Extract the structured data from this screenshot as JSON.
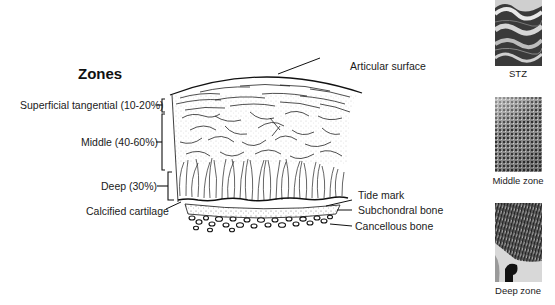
{
  "title": "Zones",
  "zone_labels": [
    {
      "label": "Superficial tangential (10-20%)"
    },
    {
      "label": "Middle (40-60%)"
    },
    {
      "label": "Deep (30%)"
    },
    {
      "label": "Calcified cartilage"
    }
  ],
  "structure_labels": [
    {
      "label": "Articular surface"
    },
    {
      "label": "Tide mark"
    },
    {
      "label": "Subchondral bone"
    },
    {
      "label": "Cancellous bone"
    }
  ],
  "micrographs": [
    {
      "caption": "STZ",
      "icon": "stz-micrograph"
    },
    {
      "caption": "Middle zone",
      "icon": "middle-zone-micrograph"
    },
    {
      "caption": "Deep zone",
      "icon": "deep-zone-micrograph"
    }
  ],
  "colors": {
    "ink": "#1a1a1a",
    "background": "#ffffff"
  }
}
